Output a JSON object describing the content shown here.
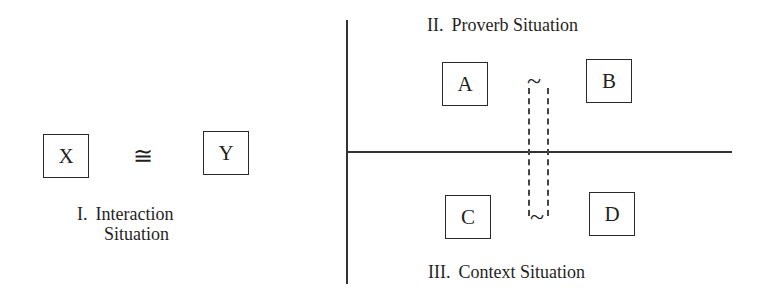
{
  "interaction": {
    "left_box": "X",
    "relation": "≅",
    "right_box": "Y",
    "caption_numeral": "I.",
    "caption_line1": "Interaction",
    "caption_line2": "Situation"
  },
  "proverb": {
    "caption_numeral": "II.",
    "caption_text": "Proverb Situation",
    "left_box": "A",
    "relation": "~",
    "right_box": "B"
  },
  "context": {
    "caption_numeral": "III.",
    "caption_text": "Context Situation",
    "left_box": "C",
    "relation": "~",
    "right_box": "D"
  }
}
